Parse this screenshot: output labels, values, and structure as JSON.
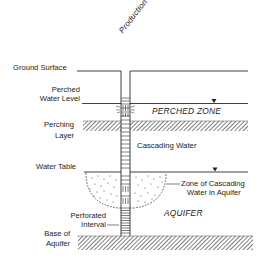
{
  "diagram": {
    "well_label": "Production Well",
    "labels": {
      "ground_surface": "Ground Surface",
      "perched_water_level_1": "Perched",
      "perched_water_level_2": "Water Level",
      "perching_layer_1": "Perching",
      "perching_layer_2": "Layer",
      "water_table": "Water Table",
      "perforated_interval_1": "Perforated",
      "perforated_interval_2": "Interval",
      "base_of_aquifer_1": "Base of",
      "base_of_aquifer_2": "Aquifer",
      "perched_zone": "PERCHED ZONE",
      "cascading_water": "Cascading Water",
      "zone_cascading_1": "Zone of Cascading",
      "zone_cascading_2": "Water in Aquifer",
      "aquifer": "AQUIFER"
    },
    "symbols": {
      "water_level_marker": "inverted-triangle"
    },
    "colors": {
      "line": "#2a2a2a",
      "background": "#ffffff"
    }
  }
}
